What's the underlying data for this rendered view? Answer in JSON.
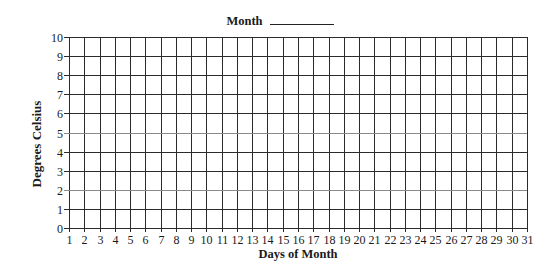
{
  "chart_data": {
    "type": "line",
    "title": "Month",
    "title_blank": "__________",
    "xlabel": "Days of Month",
    "ylabel": "Degrees Celsius",
    "x_ticks": [
      1,
      2,
      3,
      4,
      5,
      6,
      7,
      8,
      9,
      10,
      11,
      12,
      13,
      14,
      15,
      16,
      17,
      18,
      19,
      20,
      21,
      22,
      23,
      24,
      25,
      26,
      27,
      28,
      29,
      30,
      31
    ],
    "y_ticks": [
      0,
      1,
      2,
      3,
      4,
      5,
      6,
      7,
      8,
      9,
      10
    ],
    "xlim": [
      1,
      31
    ],
    "ylim": [
      0,
      10
    ],
    "grid": true,
    "series": [],
    "note": "Blank grid worksheet; no data plotted"
  },
  "colors": {
    "grid": "#2b2b2b",
    "grid_light": "#8a8a8a",
    "text": "#1a1a1a"
  }
}
